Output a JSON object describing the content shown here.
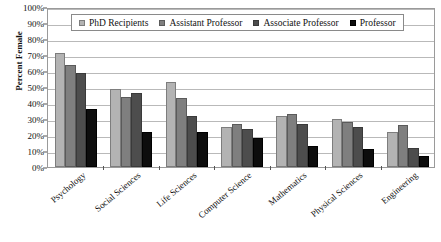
{
  "chart_data": {
    "type": "bar",
    "title": "",
    "xlabel": "",
    "ylabel": "Percent Female",
    "ylim": [
      0,
      100
    ],
    "ytick_labels": [
      "0%",
      "10%",
      "20%",
      "30%",
      "40%",
      "50%",
      "60%",
      "70%",
      "80%",
      "90%",
      "100%"
    ],
    "ytick_values": [
      0,
      10,
      20,
      30,
      40,
      50,
      60,
      70,
      80,
      90,
      100
    ],
    "grid": true,
    "legend_position": "top-center",
    "categories": [
      "Psychology",
      "Social Sciences",
      "Life Sciences",
      "Computer Science",
      "Mathematics",
      "Physical Sciences",
      "Engineering"
    ],
    "series": [
      {
        "name": "PhD Recipients",
        "color": "#b3b3b3",
        "border": "#7d7d7d",
        "values": [
          71,
          49,
          53,
          25,
          32,
          30,
          22
        ]
      },
      {
        "name": "Assistant Professor",
        "color": "#7f7f7f",
        "border": "#5a5a5a",
        "values": [
          64,
          44,
          43,
          27,
          33,
          28,
          26
        ]
      },
      {
        "name": "Associate Professor",
        "color": "#4d4d4d",
        "border": "#3a3a3a",
        "values": [
          59,
          46,
          32,
          24,
          27,
          25,
          12
        ]
      },
      {
        "name": "Professor",
        "color": "#0d0d0d",
        "border": "#000000",
        "values": [
          36,
          22,
          22,
          18,
          13,
          11,
          7
        ]
      }
    ]
  },
  "legend": {
    "items": [
      {
        "label": "PhD Recipients"
      },
      {
        "label": "Assistant Professor"
      },
      {
        "label": "Associate Professor"
      },
      {
        "label": "Professor"
      }
    ]
  },
  "axes": {
    "y_title": "Percent Female"
  }
}
